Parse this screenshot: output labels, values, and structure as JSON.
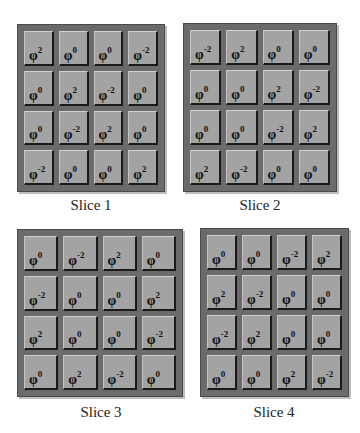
{
  "base_symbol": "φ",
  "slices": [
    {
      "label": "Slice 1",
      "cells": [
        [
          "2",
          "0",
          "0",
          "-2"
        ],
        [
          "0",
          "2",
          "-2",
          "0"
        ],
        [
          "0",
          "-2",
          "2",
          "0"
        ],
        [
          "-2",
          "0",
          "0",
          "2"
        ]
      ]
    },
    {
      "label": "Slice 2",
      "cells": [
        [
          "-2",
          "2",
          "0",
          "0"
        ],
        [
          "0",
          "0",
          "2",
          "-2"
        ],
        [
          "0",
          "0",
          "-2",
          "2"
        ],
        [
          "2",
          "-2",
          "0",
          "0"
        ]
      ]
    },
    {
      "label": "Slice 3",
      "cells": [
        [
          "0",
          "-2",
          "2",
          "0"
        ],
        [
          "-2",
          "0",
          "0",
          "2"
        ],
        [
          "2",
          "0",
          "0",
          "-2"
        ],
        [
          "0",
          "2",
          "-2",
          "0"
        ]
      ]
    },
    {
      "label": "Slice 4",
      "cells": [
        [
          "0",
          "0",
          "-2",
          "2"
        ],
        [
          "2",
          "-2",
          "0",
          "0"
        ],
        [
          "-2",
          "2",
          "0",
          "0"
        ],
        [
          "0",
          "0",
          "2",
          "-2"
        ]
      ]
    }
  ],
  "colors": {
    "frame": "#6b6b6b",
    "cell": "#a3a3a3",
    "cell_shadow": "#1a1a1a"
  }
}
